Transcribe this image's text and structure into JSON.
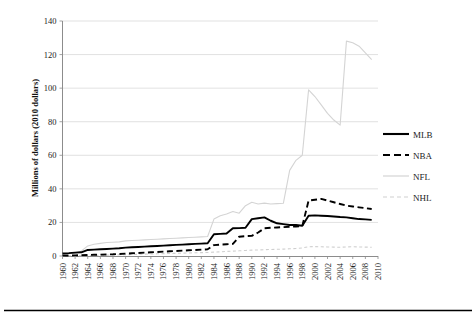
{
  "chart_data": {
    "type": "line",
    "title": "",
    "xlabel": "",
    "ylabel": "Millions of dollars (2010 dollars)",
    "xlim": [
      1960,
      2010
    ],
    "ylim": [
      0,
      140
    ],
    "ytick_step": 20,
    "xtick_step": 2,
    "grid": true,
    "legend_position": "right",
    "ytick_labels": [
      "0",
      "20",
      "40",
      "60",
      "80",
      "100",
      "120",
      "140"
    ],
    "xtick_labels": [
      "1960",
      "1962",
      "1964",
      "1966",
      "1968",
      "1970",
      "1972",
      "1974",
      "1976",
      "1978",
      "1980",
      "1982",
      "1984",
      "1986",
      "1988",
      "1990",
      "1992",
      "1994",
      "1996",
      "1998",
      "2000",
      "2002",
      "2004",
      "2006",
      "2008",
      "2010"
    ],
    "x": [
      1960,
      1961,
      1962,
      1963,
      1964,
      1965,
      1966,
      1967,
      1968,
      1969,
      1970,
      1971,
      1972,
      1973,
      1974,
      1975,
      1976,
      1977,
      1978,
      1979,
      1980,
      1981,
      1982,
      1983,
      1984,
      1985,
      1986,
      1987,
      1988,
      1989,
      1990,
      1991,
      1992,
      1993,
      1994,
      1995,
      1996,
      1997,
      1998,
      1999,
      2000,
      2001,
      2002,
      2003,
      2004,
      2005,
      2006,
      2007,
      2008,
      2009
    ],
    "series": [
      {
        "name": "MLB",
        "color": "#000000",
        "style": "solid",
        "values": [
          1.5,
          1.7,
          2.0,
          2.2,
          3.6,
          3.8,
          4.0,
          4.2,
          4.4,
          4.6,
          5.0,
          5.2,
          5.4,
          5.6,
          5.8,
          6.0,
          6.2,
          6.4,
          6.6,
          6.8,
          7.0,
          7.2,
          7.4,
          7.6,
          13.0,
          13.2,
          13.4,
          16.5,
          16.6,
          16.8,
          22.0,
          22.5,
          23.0,
          21.0,
          19.5,
          19.0,
          18.5,
          18.5,
          18.0,
          24.0,
          24.2,
          24.0,
          23.8,
          23.5,
          23.2,
          23.0,
          22.5,
          22.0,
          21.8,
          21.5
        ]
      },
      {
        "name": "NBA",
        "color": "#000000",
        "style": "dashed",
        "values": [
          0.2,
          0.3,
          0.4,
          0.5,
          0.6,
          0.7,
          0.8,
          0.9,
          1.0,
          1.2,
          1.4,
          1.6,
          1.8,
          2.0,
          2.2,
          2.4,
          2.6,
          2.8,
          3.0,
          3.2,
          3.4,
          3.6,
          3.8,
          4.0,
          6.5,
          6.8,
          7.0,
          7.2,
          11.5,
          11.8,
          12.0,
          14.0,
          16.5,
          16.8,
          17.0,
          17.2,
          17.4,
          17.6,
          17.8,
          33.0,
          33.5,
          34.0,
          33.0,
          32.0,
          31.0,
          30.0,
          29.5,
          29.0,
          28.5,
          28.0
        ]
      },
      {
        "name": "NFL",
        "color": "#d4d4d4",
        "style": "solid",
        "values": [
          1.0,
          1.3,
          1.6,
          3.0,
          6.0,
          7.0,
          7.5,
          8.0,
          8.2,
          8.4,
          9.0,
          9.2,
          9.4,
          9.6,
          9.8,
          10.0,
          10.2,
          10.4,
          10.6,
          10.8,
          11.0,
          11.2,
          11.4,
          11.6,
          22.0,
          24.0,
          25.0,
          26.5,
          25.5,
          30.0,
          32.0,
          31.0,
          31.5,
          31.0,
          31.2,
          31.4,
          51.0,
          57.0,
          60.0,
          99.0,
          95.0,
          90.0,
          85.0,
          81.0,
          78.0,
          128.0,
          127.0,
          125.0,
          121.0,
          117.0
        ]
      },
      {
        "name": "NHL",
        "color": "#cfcfcf",
        "style": "dashed",
        "values": [
          0.1,
          0.15,
          0.2,
          0.25,
          0.3,
          0.35,
          0.4,
          0.5,
          0.6,
          0.7,
          0.8,
          0.9,
          1.0,
          1.1,
          1.2,
          1.3,
          1.4,
          1.5,
          1.6,
          1.7,
          1.8,
          1.9,
          2.0,
          2.1,
          2.3,
          2.5,
          2.7,
          2.9,
          3.1,
          3.3,
          3.5,
          3.6,
          3.8,
          3.9,
          4.0,
          4.1,
          4.3,
          4.5,
          4.8,
          5.5,
          5.6,
          5.5,
          5.4,
          5.3,
          5.2,
          5.4,
          5.5,
          5.4,
          5.3,
          5.2
        ]
      }
    ]
  },
  "legend": {
    "items": [
      {
        "label": "MLB"
      },
      {
        "label": "NBA"
      },
      {
        "label": "NFL"
      },
      {
        "label": "NHL"
      }
    ]
  }
}
